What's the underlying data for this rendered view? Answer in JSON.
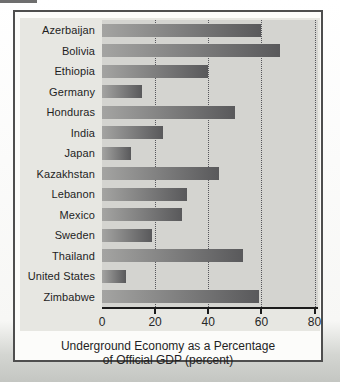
{
  "figure": {
    "caption_line1": "Underground Economy as a Percentage",
    "caption_line2": "of Official GDP (percent)"
  },
  "chart_data": {
    "type": "bar",
    "orientation": "horizontal",
    "title": "",
    "xlabel": "Underground Economy as a Percentage of Official GDP (percent)",
    "ylabel": "",
    "categories": [
      "Azerbaijan",
      "Bolivia",
      "Ethiopia",
      "Germany",
      "Honduras",
      "India",
      "Japan",
      "Kazakhstan",
      "Lebanon",
      "Mexico",
      "Sweden",
      "Thailand",
      "United States",
      "Zimbabwe"
    ],
    "values": [
      60,
      67,
      40,
      15,
      50,
      23,
      11,
      44,
      32,
      30,
      19,
      53,
      9,
      59
    ],
    "xticks": [
      0,
      20,
      40,
      60,
      80
    ],
    "xlim": [
      0,
      81.3
    ],
    "grid": "dotted-vertical",
    "legend": "none",
    "colors": {
      "bar_gradient_left": "#a4a4a2",
      "bar_gradient_right": "#59595b",
      "plot_bg": "#d4d4d0",
      "panel_bg": "#e7e7e2",
      "box_border": "#4e4e4e",
      "axis_line": "#1b1b1b",
      "gridline": "#55555a"
    }
  }
}
